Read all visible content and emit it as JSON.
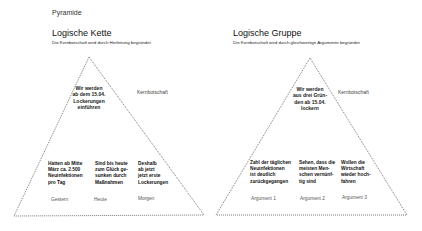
{
  "page_title": "Pyramide",
  "left": {
    "title": "Logische Kette",
    "subtitle": "Die Kernbotschaft wird durch Herleitung begründet",
    "core_message": [
      "Wir werden",
      "ab dem 15.04.",
      "Lockerungen",
      "einführen"
    ],
    "core_label": "Kernbotschaft",
    "columns": [
      {
        "lines": [
          "Hatten ab Mitte",
          "März ca. 2.500",
          "Neuinfektionen",
          "pro Tag"
        ],
        "footer": "Gestern"
      },
      {
        "lines": [
          "Sind bis heute",
          "zum Glück ge-",
          "sunken durch",
          "Maßnahmen"
        ],
        "footer": "Heute"
      },
      {
        "lines": [
          "Deshalb",
          "ab jetzt",
          "jetzt erste",
          "Lockerungen"
        ],
        "footer": "Morgen"
      }
    ]
  },
  "right": {
    "title": "Logische Gruppe",
    "subtitle": "Die Kernbotschaft wird durch gleichwertige Argumente begründet",
    "core_message": [
      "Wir werden",
      "aus drei Grün-",
      "den ab 15.04.",
      "lockern"
    ],
    "core_label": "Kernbotschaft",
    "columns": [
      {
        "lines": [
          "Zahl der täglichen",
          "Neuinfektionen",
          "ist deutlich",
          "zurückgegangen"
        ],
        "footer": "Argument 1"
      },
      {
        "lines": [
          "Sehen, dass die",
          "meisten Men-",
          "schen vernünf-",
          "tig sind"
        ],
        "footer": "Argument 2"
      },
      {
        "lines": [
          "Wollen die",
          "Wirtschaft",
          "wieder hoch-",
          "fahren"
        ],
        "footer": "Argument 3"
      }
    ]
  },
  "colors": {
    "line": "#555555",
    "text": "#1a1a1a"
  }
}
